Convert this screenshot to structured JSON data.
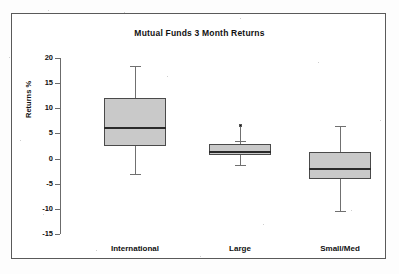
{
  "figure": {
    "title": "Mutual Funds 3 Month Returns",
    "ylabel": "Returns %",
    "background": "#ffffff",
    "frame_color": "#5a5a5a",
    "box_fill": "#c9c9c9",
    "box_edge": "#4a4a4a",
    "median_color": "#2a2a2a",
    "whisker_color": "#707070"
  },
  "axis": {
    "ticks": [
      {
        "label": "20",
        "value": 20
      },
      {
        "label": "15",
        "value": 15
      },
      {
        "label": "10",
        "value": 10
      },
      {
        "label": "5",
        "value": 5
      },
      {
        "label": "0",
        "value": 0
      },
      {
        "label": "-5",
        "value": -5
      },
      {
        "label": "-10",
        "value": -10
      },
      {
        "label": "-15",
        "value": -15
      }
    ]
  },
  "chart_data": {
    "type": "box",
    "title": "Mutual Funds 3 Month Returns",
    "xlabel": "",
    "ylabel": "Returns %",
    "ylim": [
      -15,
      20
    ],
    "grid": false,
    "legend": null,
    "categories": [
      "International",
      "Large",
      "Small/Med"
    ],
    "boxes": [
      {
        "category": "International",
        "whisker_low": -3.0,
        "q1": 2.5,
        "median": 6.0,
        "q3": 12.0,
        "whisker_high": 18.5,
        "outliers": []
      },
      {
        "category": "Large",
        "whisker_low": -1.2,
        "q1": 0.8,
        "median": 1.3,
        "q3": 2.8,
        "whisker_high": 3.5,
        "outliers": [
          6.5
        ]
      },
      {
        "category": "Small/Med",
        "whisker_low": -10.5,
        "q1": -4.0,
        "median": -2.0,
        "q3": 1.3,
        "whisker_high": 6.5,
        "outliers": []
      }
    ]
  }
}
